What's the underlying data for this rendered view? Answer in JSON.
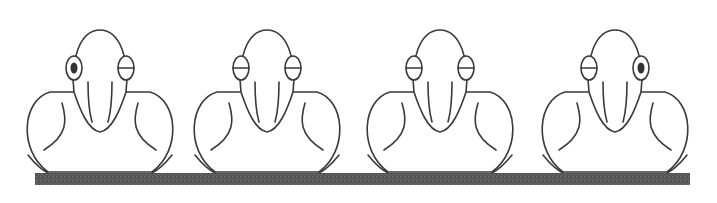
{
  "diagram": {
    "perch": {
      "x": 35,
      "y": 173,
      "width": 655,
      "height": 12,
      "color": "#555555"
    },
    "birds": [
      {
        "cx": 100,
        "left_eye": "open",
        "right_eye": "closed"
      },
      {
        "cx": 267,
        "left_eye": "closed",
        "right_eye": "closed"
      },
      {
        "cx": 440,
        "left_eye": "closed",
        "right_eye": "closed"
      },
      {
        "cx": 615,
        "left_eye": "closed",
        "right_eye": "open"
      }
    ]
  }
}
